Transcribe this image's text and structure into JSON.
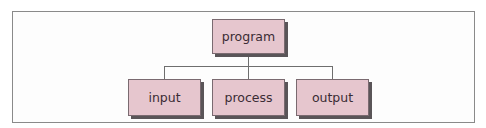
{
  "diagram": {
    "type": "hierarchy",
    "root": {
      "label": "program"
    },
    "children": [
      {
        "label": "input"
      },
      {
        "label": "process"
      },
      {
        "label": "output"
      }
    ],
    "colors": {
      "node_fill": "#e6c6ce",
      "node_border": "#7a6a70",
      "node_shadow": "#5a5558",
      "text": "#3a2c34",
      "connector": "#6e6e6e",
      "frame_border": "#8a8a8a"
    }
  }
}
